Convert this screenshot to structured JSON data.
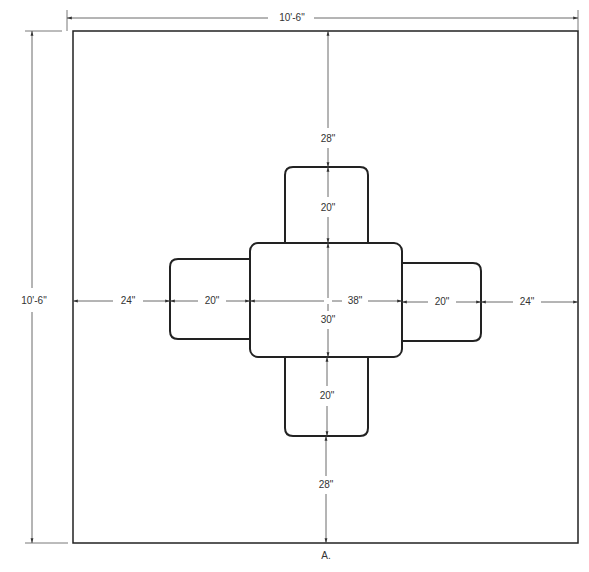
{
  "diagram": {
    "type": "floor-plan",
    "caption": "A.",
    "room": {
      "width_label": "10'-6\"",
      "height_label": "10'-6\""
    },
    "table": {
      "width_label": "38\"",
      "depth_label": "30\""
    },
    "chairs": {
      "top": {
        "depth_label": "20\"",
        "clearance_label": "28\""
      },
      "bottom": {
        "depth_label": "20\"",
        "clearance_label": "28\""
      },
      "left": {
        "depth_label": "20\"",
        "clearance_label": "24\""
      },
      "right": {
        "depth_label": "20\"",
        "clearance_label": "24\""
      }
    },
    "colors": {
      "line": "#222222",
      "dim_line": "#444444",
      "text": "#333333",
      "background": "#ffffff"
    }
  }
}
